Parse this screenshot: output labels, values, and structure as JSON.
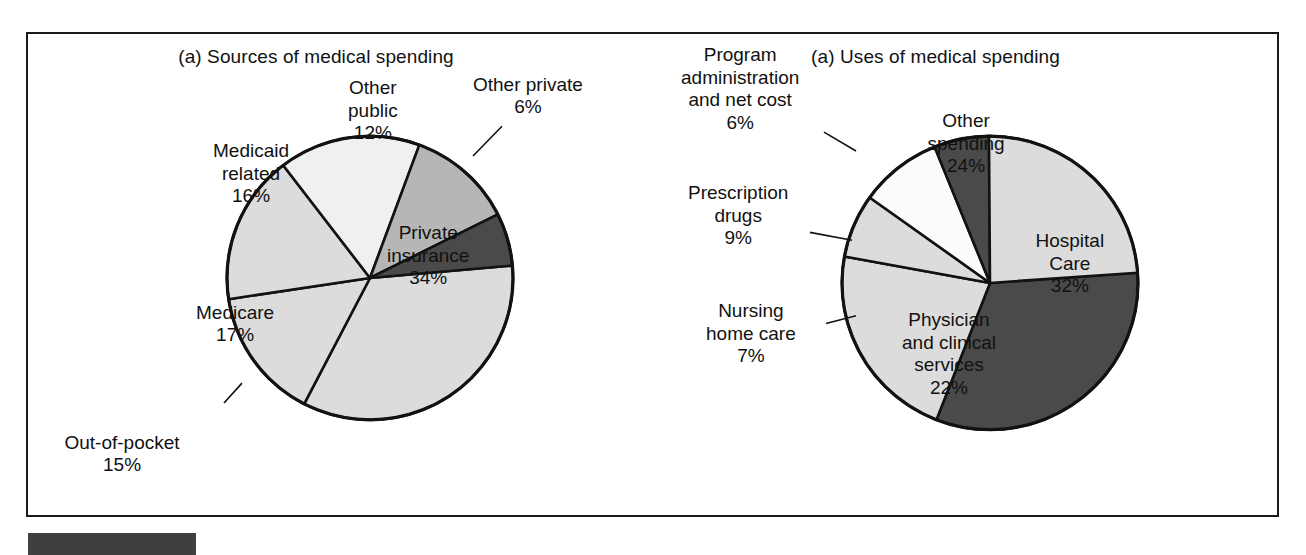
{
  "figure": {
    "background_color": "#ffffff",
    "frame_color": "#1a1a1a",
    "bottom_bar_color": "#3f3f3f"
  },
  "palette": {
    "light_gray": "#dcdcdc",
    "white": "#fbfbfb",
    "medium_gray": "#b6b6b6",
    "dark_gray": "#4a4a4a",
    "outline": "#121212"
  },
  "panels": [
    {
      "id": "sources",
      "title": "(a) Sources of medical spending"
    },
    {
      "id": "uses",
      "title": "(a) Uses of medical spending"
    }
  ],
  "chart_data": [
    {
      "type": "pie",
      "title": "(a) Sources of medical spending",
      "xlabel": "",
      "ylabel": "",
      "legend": "none",
      "grid": false,
      "total": 100,
      "units": "percent",
      "categories": [
        "Private insurance",
        "Out-of-pocket",
        "Medicare",
        "Medicaid related",
        "Other public",
        "Other private"
      ],
      "values": [
        34,
        15,
        17,
        16,
        12,
        6
      ],
      "slices": [
        {
          "label": "Private insurance",
          "value": 34,
          "value_text": "34%",
          "label_lines": [
            "Private",
            "insurance",
            "34%"
          ],
          "color": "#dcdcdc",
          "label_placement": "inside",
          "leader": false
        },
        {
          "label": "Out-of-pocket",
          "value": 15,
          "value_text": "15%",
          "label_lines": [
            "Out-of-pocket",
            "15%"
          ],
          "color": "#dcdcdc",
          "label_placement": "outside",
          "leader": true
        },
        {
          "label": "Medicare",
          "value": 17,
          "value_text": "17%",
          "label_lines": [
            "Medicare",
            "17%"
          ],
          "color": "#dcdcdc",
          "label_placement": "inside",
          "leader": false
        },
        {
          "label": "Medicaid related",
          "value": 16,
          "value_text": "16%",
          "label_lines": [
            "Medicaid",
            "related",
            "16%"
          ],
          "color": "#f0f0f0",
          "label_placement": "inside",
          "leader": false
        },
        {
          "label": "Other public",
          "value": 12,
          "value_text": "12%",
          "label_lines": [
            "Other",
            "public",
            "12%"
          ],
          "color": "#b6b6b6",
          "label_placement": "inside",
          "leader": false
        },
        {
          "label": "Other private",
          "value": 6,
          "value_text": "6%",
          "label_lines": [
            "Other private",
            "6%"
          ],
          "color": "#4a4a4a",
          "label_placement": "outside",
          "leader": true
        }
      ]
    },
    {
      "type": "pie",
      "title": "(a) Uses of medical spending",
      "xlabel": "",
      "ylabel": "",
      "legend": "none",
      "grid": false,
      "total": 100,
      "units": "percent",
      "categories": [
        "Hospital Care",
        "Physician and clinical services",
        "Nursing home care",
        "Prescription drugs",
        "Program administration and net cost",
        "Other spending"
      ],
      "values": [
        32,
        22,
        7,
        9,
        6,
        24
      ],
      "slices": [
        {
          "label": "Hospital Care",
          "value": 32,
          "value_text": "32%",
          "label_lines": [
            "Hospital",
            "Care",
            "32%"
          ],
          "color": "#4a4a4a",
          "label_placement": "inside",
          "leader": false
        },
        {
          "label": "Physician and clinical services",
          "value": 22,
          "value_text": "22%",
          "label_lines": [
            "Physician",
            "and clinical",
            "services",
            "22%"
          ],
          "color": "#dcdcdc",
          "label_placement": "inside",
          "leader": false
        },
        {
          "label": "Nursing home care",
          "value": 7,
          "value_text": "7%",
          "label_lines": [
            "Nursing",
            "home care",
            "7%"
          ],
          "color": "#dcdcdc",
          "label_placement": "outside",
          "leader": true
        },
        {
          "label": "Prescription drugs",
          "value": 9,
          "value_text": "9%",
          "label_lines": [
            "Prescription",
            "drugs",
            "9%"
          ],
          "color": "#fbfbfb",
          "label_placement": "outside",
          "leader": true
        },
        {
          "label": "Program administration and net cost",
          "value": 6,
          "value_text": "6%",
          "label_lines": [
            "Program",
            "administration",
            "and net cost",
            "6%"
          ],
          "color": "#4a4a4a",
          "label_placement": "outside",
          "leader": true
        },
        {
          "label": "Other spending",
          "value": 24,
          "value_text": "24%",
          "label_lines": [
            "Other",
            "spending",
            "24%"
          ],
          "color": "#dcdcdc",
          "label_placement": "inside",
          "leader": false
        }
      ]
    }
  ],
  "geometry": {
    "sources": {
      "cx": 342,
      "cy": 246,
      "r": 143,
      "start_angle_deg": -5,
      "direction": "clockwise"
    },
    "uses": {
      "cx": 362,
      "cy": 251,
      "r": 148,
      "start_angle_deg": -4,
      "direction": "clockwise"
    }
  },
  "label_positions": {
    "sources": [
      {
        "label": "Private insurance",
        "x": 400,
        "y": 222,
        "anchor": "center"
      },
      {
        "label": "Out-of-pocket",
        "x": 94,
        "y": 420,
        "anchor": "center"
      },
      {
        "label": "Medicare",
        "x": 207,
        "y": 290,
        "anchor": "center"
      },
      {
        "label": "Medicaid related",
        "x": 223,
        "y": 140,
        "anchor": "center"
      },
      {
        "label": "Other public",
        "x": 345,
        "y": 77,
        "anchor": "center"
      },
      {
        "label": "Other private",
        "x": 500,
        "y": 62,
        "anchor": "center"
      }
    ],
    "uses": [
      {
        "label": "Hospital Care",
        "x": 442,
        "y": 230,
        "anchor": "center"
      },
      {
        "label": "Physician and clinical services",
        "x": 321,
        "y": 320,
        "anchor": "center"
      },
      {
        "label": "Nursing home care",
        "x": 123,
        "y": 300,
        "anchor": "center"
      },
      {
        "label": "Prescription drugs",
        "x": 110,
        "y": 182,
        "anchor": "center"
      },
      {
        "label": "Program administration and net cost",
        "x": 112,
        "y": 55,
        "anchor": "center"
      },
      {
        "label": "Other spending",
        "x": 338,
        "y": 110,
        "anchor": "center"
      }
    ]
  },
  "leader_lines": {
    "sources": [
      {
        "label": "Other private",
        "x1": 474,
        "y1": 93,
        "x2": 445,
        "y2": 123
      },
      {
        "label": "Out-of-pocket",
        "x1": 196,
        "y1": 372,
        "x2": 214,
        "y2": 352
      }
    ],
    "uses": [
      {
        "label": "Program administration and net cost",
        "x1": 196,
        "y1": 99,
        "x2": 228,
        "y2": 118
      },
      {
        "label": "Prescription drugs",
        "x1": 182,
        "y1": 200,
        "x2": 224,
        "y2": 208
      },
      {
        "label": "Nursing home care",
        "x1": 198,
        "y1": 292,
        "x2": 228,
        "y2": 284
      }
    ]
  }
}
